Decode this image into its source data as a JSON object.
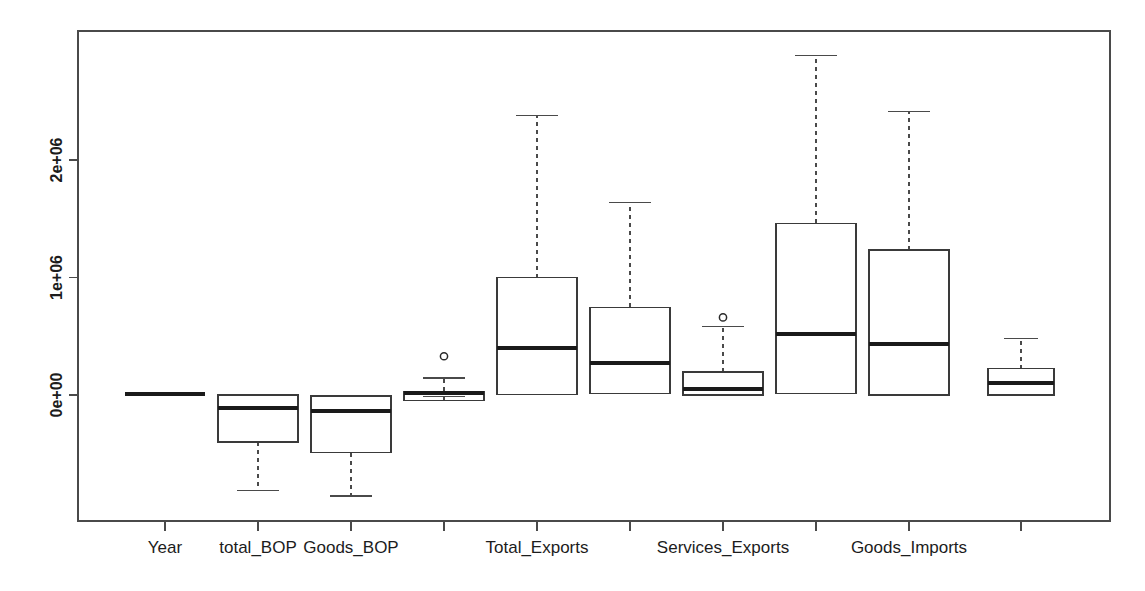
{
  "chart_data": {
    "type": "box",
    "title": "",
    "xlabel": "",
    "ylabel": "",
    "grid": false,
    "legend": "none",
    "ylim": [
      -800000,
      2950000
    ],
    "y_ticks": [
      {
        "label": "0e+00",
        "value": 0
      },
      {
        "label": "1e+06",
        "value": 1000000
      },
      {
        "label": "2e+06",
        "value": 2000000
      }
    ],
    "categories": [
      "Year",
      "total_BOP",
      "Goods_BOP",
      "Services_BOP",
      "Total_Exports",
      "Goods_Exports",
      "Services_Exports",
      "Total_Imports",
      "Goods_Imports",
      "Services_Imports"
    ],
    "x_tick_labels_shown": [
      "Year",
      "total_BOP",
      "Goods_BOP",
      "",
      "Total_Exports",
      "",
      "Services_Exports",
      "",
      "Goods_Imports",
      ""
    ],
    "boxes": [
      {
        "name": "Year",
        "min": 5000,
        "q1": 5000,
        "median": 5000,
        "q3": 5000,
        "max": 5000,
        "outliers": [],
        "width_px": 80
      },
      {
        "name": "total_BOP",
        "min": -815000,
        "q1": -400000,
        "median": -110000,
        "q3": 0,
        "max": 0,
        "outliers": [],
        "width_px": 80
      },
      {
        "name": "Goods_BOP",
        "min": -860000,
        "q1": -490000,
        "median": -140000,
        "q3": -8000,
        "max": -8000,
        "outliers": [],
        "width_px": 80
      },
      {
        "name": "Services_BOP",
        "min": -15000,
        "q1": -45000,
        "median": 15000,
        "q3": 30000,
        "max": 145000,
        "outliers": [
          330000
        ],
        "width_px": 80
      },
      {
        "name": "Total_Exports",
        "min": 0,
        "q1": 5000,
        "median": 400000,
        "q3": 1000000,
        "max": 2380000,
        "outliers": [],
        "width_px": 80
      },
      {
        "name": "Goods_Exports",
        "min": 0,
        "q1": 10000,
        "median": 275000,
        "q3": 745000,
        "max": 1640000,
        "outliers": [],
        "width_px": 80
      },
      {
        "name": "Services_Exports",
        "min": 0,
        "q1": 0,
        "median": 55000,
        "q3": 195000,
        "max": 585000,
        "outliers": [
          660000
        ],
        "width_px": 80
      },
      {
        "name": "Total_Imports",
        "min": 0,
        "q1": 10000,
        "median": 520000,
        "q3": 1460000,
        "max": 2890000,
        "outliers": [],
        "width_px": 80
      },
      {
        "name": "Goods_Imports",
        "min": -10000,
        "q1": 0,
        "median": 435000,
        "q3": 1235000,
        "max": 2410000,
        "outliers": [],
        "width_px": 80
      },
      {
        "name": "Services_Imports",
        "min": 0,
        "q1": 0,
        "median": 100000,
        "q3": 225000,
        "max": 480000,
        "outliers": [],
        "width_px": 66
      }
    ]
  },
  "plot": {
    "frame": {
      "left": 78,
      "top": 31,
      "right": 1110,
      "bottom": 521
    },
    "x_positions": [
      165,
      258,
      351,
      444,
      537,
      630,
      723,
      816,
      909,
      1021
    ],
    "y_axis_label_0": "0e+00",
    "y_axis_label_1": "1e+06",
    "y_axis_label_2": "2e+06"
  }
}
